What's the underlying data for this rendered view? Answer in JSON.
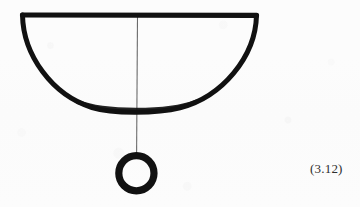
{
  "figure": {
    "caption_number": "(3.12)",
    "background_color": "#fcfcfc",
    "ink_color": "#111111",
    "thread_color": "#666666",
    "elements": {
      "bowl": {
        "name": "hemispherical-bowl",
        "rim_left_x": 22,
        "rim_right_x": 257,
        "rim_y": 15,
        "bottom_y": 110,
        "stroke_width": 5
      },
      "thread": {
        "name": "vertical-thread",
        "x": 137,
        "top_y": 16,
        "bottom_y": 153,
        "stroke_width": 1
      },
      "ring": {
        "name": "hanging-ring",
        "center_x": 136,
        "center_y": 173,
        "outer_radius": 21,
        "stroke_width": 7
      }
    }
  }
}
